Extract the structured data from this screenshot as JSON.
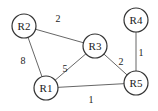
{
  "diagram": {
    "type": "weighted-undirected-graph",
    "nodes": [
      {
        "id": "R1",
        "label": "R1",
        "x": 46,
        "y": 88
      },
      {
        "id": "R2",
        "label": "R2",
        "x": 24,
        "y": 26
      },
      {
        "id": "R3",
        "label": "R3",
        "x": 95,
        "y": 46
      },
      {
        "id": "R4",
        "label": "R4",
        "x": 136,
        "y": 20
      },
      {
        "id": "R5",
        "label": "R5",
        "x": 136,
        "y": 83
      }
    ],
    "edges": [
      {
        "from": "R2",
        "to": "R3",
        "weight": "2",
        "lx": 58,
        "ly": 18
      },
      {
        "from": "R2",
        "to": "R1",
        "weight": "8",
        "lx": 23,
        "ly": 60
      },
      {
        "from": "R1",
        "to": "R3",
        "weight": "5",
        "lx": 65,
        "ly": 68
      },
      {
        "from": "R1",
        "to": "R5",
        "weight": "1",
        "lx": 91,
        "ly": 99
      },
      {
        "from": "R3",
        "to": "R5",
        "weight": "2",
        "lx": 121,
        "ly": 61
      },
      {
        "from": "R4",
        "to": "R5",
        "weight": "1",
        "lx": 141,
        "ly": 52
      }
    ],
    "node_radius": 12
  }
}
